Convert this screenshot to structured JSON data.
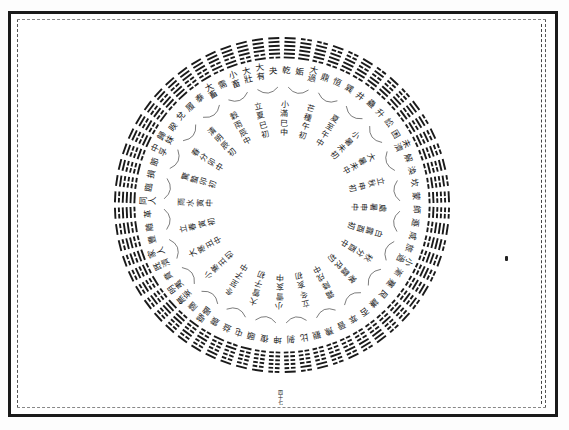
{
  "document": {
    "title": "卦氣圖",
    "page_number": "四十七",
    "diagram": {
      "center": [
        282,
        205
      ],
      "hexagram_ring_outer_radius": 167,
      "hexagram_ring_inner_radius": 146,
      "ink_color": "#1a1a1a",
      "hexagrams_count": 64,
      "top_arc_names": [
        "小畜",
        "大有",
        "夬",
        "乾",
        "姤",
        "大過",
        "鼎",
        "恒",
        "巽",
        "井",
        "蠱"
      ],
      "top_arc_names_left_to_right": [
        "需",
        "小畜",
        "大壯",
        "大有",
        "夬",
        "乾",
        "姤",
        "大過",
        "鼎",
        "恒",
        "巽",
        "井"
      ],
      "solar_term_labels": [
        "小滿巳中",
        "芒種午初",
        "夏至午中",
        "小暑未初",
        "大暑未中",
        "立秋申初",
        "處暑申中",
        "白露酉初",
        "秋分酉中",
        "寒露戌初",
        "霜降戌中",
        "立冬亥初",
        "小雪亥中",
        "大雪子初",
        "冬至子中",
        "小寒丑初",
        "大寒丑中",
        "立春寅初",
        "雨水寅中",
        "驚蟄卯初",
        "春分卯中",
        "清明辰初",
        "穀雨辰中",
        "立夏巳初"
      ],
      "ring_labels": [
        "乾",
        "姤",
        "大過",
        "鼎",
        "恒",
        "巽",
        "井",
        "蠱",
        "升",
        "訟",
        "困",
        "未濟",
        "解",
        "渙",
        "坎",
        "蒙",
        "師",
        "遯",
        "咸",
        "旅",
        "小過",
        "漸",
        "蹇",
        "艮",
        "謙",
        "否",
        "萃",
        "晉",
        "豫",
        "觀",
        "比",
        "剝",
        "坤",
        "復",
        "頤",
        "屯",
        "益",
        "震",
        "噬嗑",
        "隨",
        "無妄",
        "明夷",
        "賁",
        "既濟",
        "家人",
        "豐",
        "離",
        "革",
        "同人",
        "臨",
        "損",
        "節",
        "中孚",
        "歸妹",
        "睽",
        "兌",
        "履",
        "泰",
        "大畜",
        "需",
        "小畜",
        "大壯",
        "大有",
        "夬"
      ],
      "hexagram_lines": [
        "111111",
        "011111",
        "011110",
        "101110",
        "001110",
        "110110",
        "010110",
        "100110",
        "000110",
        "111010",
        "011010",
        "101010",
        "001010",
        "110010",
        "010010",
        "100010",
        "000010",
        "111100",
        "011100",
        "101100",
        "001100",
        "110100",
        "010100",
        "100100",
        "000100",
        "111000",
        "011000",
        "101000",
        "001000",
        "110000",
        "010000",
        "100000",
        "000000",
        "100000",
        "100001",
        "100010",
        "110001",
        "100100",
        "101001",
        "100110",
        "100111",
        "101000",
        "101001",
        "101010",
        "101011",
        "101100",
        "101101",
        "101110",
        "101111",
        "110000",
        "110001",
        "110010",
        "110011",
        "110100",
        "110101",
        "110110",
        "110111",
        "111000",
        "111001",
        "111010",
        "111011",
        "111100",
        "111101",
        "111110"
      ]
    }
  }
}
